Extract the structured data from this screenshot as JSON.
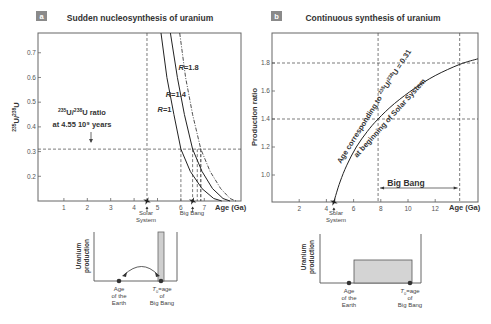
{
  "panels": [
    {
      "letter": "a",
      "title": "Sudden nucleosynthesis of uranium",
      "ylabel_sup1": "235",
      "ylabel_mid": "U/",
      "ylabel_sup2": "238",
      "ylabel_end": "U",
      "xlabel": "Age (Ga)",
      "annotation_line1_sup1": "235",
      "annotation_line1_mid": "U/",
      "annotation_line1_sup2": "238",
      "annotation_line1_end": "U ratio",
      "annotation_line2": "at 4.55 10⁹ years",
      "marker_solar": [
        "Solar",
        "System"
      ],
      "marker_bigbang": "Big Bang",
      "inset": {
        "ylabel": [
          "Uranium",
          "production"
        ],
        "left_label": [
          "Age",
          "of the",
          "Earth"
        ],
        "right_label_italic": "T",
        "right_label_sub": "0",
        "right_label": [
          "=age",
          "of",
          "Big Bang"
        ]
      }
    },
    {
      "letter": "b",
      "title": "Continuous synthesis of uranium",
      "ylabel": "Production ratio",
      "xlabel": "Age (Ga)",
      "curve_label_line1_pre": "Age corresponding to ",
      "curve_label_line1_sup1": "235",
      "curve_label_line1_mid": "U/",
      "curve_label_line1_sup2": "238",
      "curve_label_line1_end": "U = 0.31",
      "curve_label_line2": "at beginning of Solar System",
      "bigbang_label": "Big Bang",
      "marker_solar": [
        "Solar",
        "System"
      ],
      "inset": {
        "ylabel": [
          "Uranium",
          "production"
        ],
        "left_label": [
          "Age",
          "of the",
          "Earth"
        ],
        "right_label_italic": "T",
        "right_label_sub": "0",
        "right_label": [
          "=age",
          "of",
          "Big Bang"
        ]
      }
    }
  ],
  "chart_data": [
    {
      "type": "line",
      "title": "Sudden nucleosynthesis of uranium",
      "xlabel": "Age (Ga)",
      "ylabel": "235U/238U",
      "xlim": [
        0,
        8.6
      ],
      "ylim": [
        0.1,
        0.78
      ],
      "x_ticks": [
        1,
        2,
        3,
        4,
        5,
        6,
        7
      ],
      "y_ticks": [
        0.2,
        0.3,
        0.4,
        0.5,
        0.6,
        0.7
      ],
      "y_tick_labels": [
        "0.2",
        "0.3",
        "0.4",
        "0.5",
        "0.6",
        "0.7"
      ],
      "reference_lines": {
        "horizontal": 0.31,
        "vertical_solar_system": 4.55
      },
      "series": [
        {
          "name": "R=1",
          "label": "R=1",
          "style": "solid",
          "crossing_age": 6.0,
          "x": [
            5.15,
            5.4,
            5.7,
            6.0,
            6.4,
            6.9,
            7.4,
            7.75
          ],
          "y": [
            0.78,
            0.6,
            0.45,
            0.31,
            0.22,
            0.15,
            0.11,
            0.1
          ]
        },
        {
          "name": "R=1.4",
          "label": "R=1.4",
          "style": "solid",
          "crossing_age": 6.5,
          "x": [
            5.55,
            5.85,
            6.15,
            6.5,
            6.9,
            7.35,
            7.8,
            8.1
          ],
          "y": [
            0.78,
            0.6,
            0.45,
            0.31,
            0.22,
            0.15,
            0.11,
            0.1
          ]
        },
        {
          "name": "R=1.8",
          "label": "R=1.8",
          "style": "dash-dot",
          "crossing_age": 6.85,
          "x": [
            5.95,
            6.2,
            6.5,
            6.85,
            7.25,
            7.7,
            8.1,
            8.35
          ],
          "y": [
            0.78,
            0.6,
            0.45,
            0.31,
            0.22,
            0.15,
            0.11,
            0.1
          ]
        }
      ],
      "markers": [
        {
          "name": "Solar System",
          "x": 4.55
        },
        {
          "name": "Big Bang",
          "x": 6.5
        }
      ],
      "extra_verticals": [
        6.7,
        6.85
      ]
    },
    {
      "type": "line",
      "title": "Continuous synthesis of uranium",
      "xlabel": "Age (Ga)",
      "ylabel": "Production ratio",
      "xlim": [
        0,
        15.2
      ],
      "ylim": [
        0.81,
        2.0
      ],
      "x_ticks": [
        2,
        4,
        6,
        8,
        10,
        12
      ],
      "y_ticks": [
        1.0,
        1.2,
        1.4,
        1.6,
        1.8
      ],
      "y_tick_labels": [
        "1.0",
        "1.2",
        "1.4",
        "1.6",
        "1.8"
      ],
      "reference_lines": {
        "horizontal": [
          1.4,
          1.8
        ],
        "vertical": [
          7.8,
          13.8
        ]
      },
      "series": [
        {
          "name": "production ratio curve",
          "x": [
            4.55,
            5.0,
            5.5,
            6.2,
            7.0,
            7.8,
            9.0,
            10.5,
            12.0,
            13.8,
            15.2
          ],
          "y": [
            0.81,
            0.95,
            1.07,
            1.2,
            1.31,
            1.4,
            1.51,
            1.62,
            1.71,
            1.79,
            1.83
          ]
        }
      ],
      "span": {
        "label": "Big Bang",
        "from": 7.8,
        "to": 13.8
      },
      "markers": [
        {
          "name": "Solar System",
          "x": 4.55
        }
      ]
    }
  ]
}
